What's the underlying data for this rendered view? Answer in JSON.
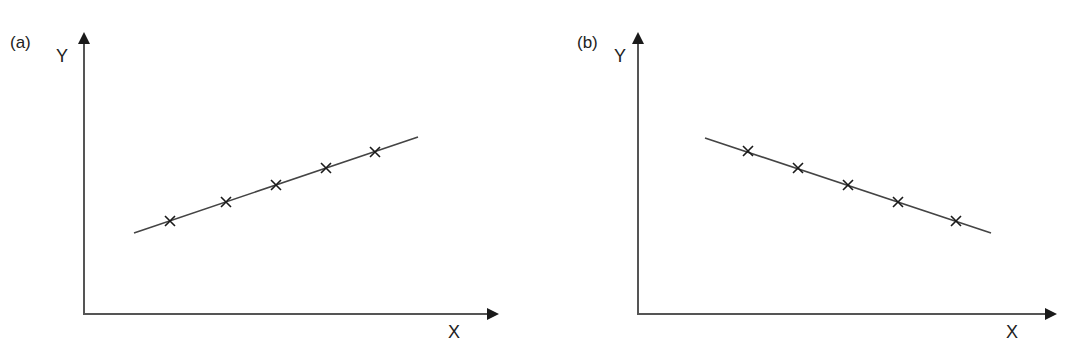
{
  "panels": [
    {
      "id": "a",
      "label": "(a)",
      "x_axis_label": "X",
      "y_axis_label": "Y",
      "trend": "positive",
      "line": {
        "x1": 134,
        "y1": 233,
        "x2": 418,
        "y2": 137
      },
      "markers": [
        [
          170,
          221
        ],
        [
          226,
          202
        ],
        [
          276,
          185
        ],
        [
          326,
          168
        ],
        [
          375,
          152
        ]
      ]
    },
    {
      "id": "b",
      "label": "(b)",
      "x_axis_label": "X",
      "y_axis_label": "Y",
      "trend": "negative",
      "line": {
        "x1": 705,
        "y1": 138,
        "x2": 991,
        "y2": 233
      },
      "markers": [
        [
          748,
          151
        ],
        [
          798,
          168
        ],
        [
          848,
          185
        ],
        [
          898,
          202
        ],
        [
          956,
          221
        ]
      ]
    }
  ],
  "colors": {
    "ink": "#2a2a2a",
    "background": "#ffffff"
  }
}
